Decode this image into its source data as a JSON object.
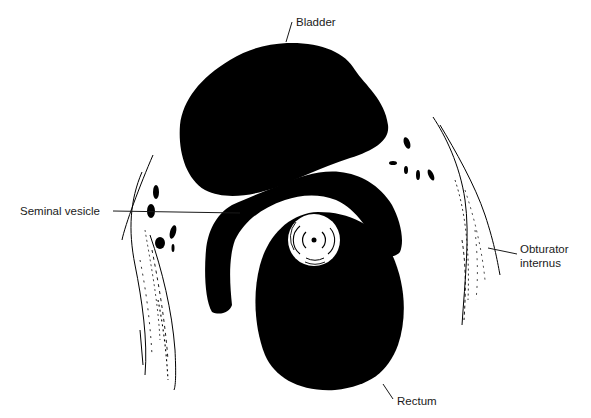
{
  "diagram": {
    "colors": {
      "organ_fill": "#000000",
      "background": "#ffffff",
      "leader_line": "#1a1a1a",
      "text": "#1a1a1a"
    },
    "labels": {
      "bladder": "Bladder",
      "seminal_vesicle": "Seminal vesicle",
      "obturator_line1": "Obturator",
      "obturator_line2": "internus",
      "rectum": "Rectum"
    },
    "structures": [
      "bladder",
      "seminal-vesicle",
      "prostate-urethra",
      "rectum",
      "left-obturator-internus",
      "right-obturator-internus"
    ]
  }
}
